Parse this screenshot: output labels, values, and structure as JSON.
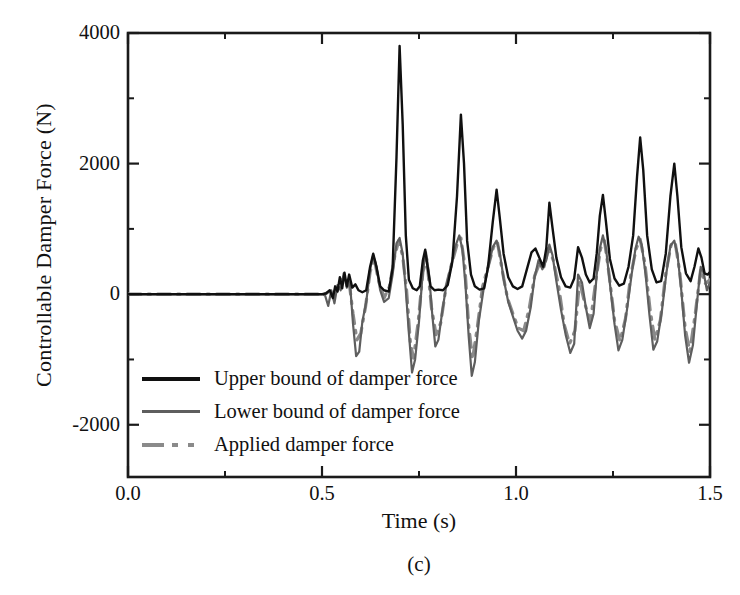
{
  "figure": {
    "panel_caption": "(c)"
  },
  "chart_data": {
    "type": "line",
    "title": "",
    "xlabel": "Time (s)",
    "ylabel": "Controllable Damper Force (N)",
    "xlim": [
      0.0,
      1.5
    ],
    "ylim": [
      -2800,
      4000
    ],
    "grid": false,
    "legend_position": "lower-left-inside",
    "x_major_ticks": [
      0.0,
      0.5,
      1.0,
      1.5
    ],
    "x_major_tick_labels": [
      "0.0",
      "0.5",
      "1.0",
      "1.5"
    ],
    "x_minor_ticks": [
      0.25,
      0.75,
      1.25
    ],
    "y_major_ticks": [
      -2000,
      0,
      2000,
      4000
    ],
    "y_major_tick_labels": [
      "-2000",
      "0",
      "2000",
      "4000"
    ],
    "y_minor_ticks": [
      -1000,
      1000,
      3000
    ],
    "excitation_start_time": 0.5,
    "series": [
      {
        "name": "Upper bound of damper force",
        "color": "#101010",
        "style": "solid",
        "width": 2.4,
        "points": [
          [
            0.0,
            0
          ],
          [
            0.48,
            0
          ],
          [
            0.5,
            0
          ],
          [
            0.51,
            10
          ],
          [
            0.52,
            60
          ],
          [
            0.528,
            -60
          ],
          [
            0.534,
            120
          ],
          [
            0.54,
            40
          ],
          [
            0.546,
            260
          ],
          [
            0.552,
            90
          ],
          [
            0.558,
            330
          ],
          [
            0.564,
            120
          ],
          [
            0.57,
            300
          ],
          [
            0.578,
            100
          ],
          [
            0.586,
            150
          ],
          [
            0.594,
            60
          ],
          [
            0.604,
            30
          ],
          [
            0.614,
            60
          ],
          [
            0.624,
            420
          ],
          [
            0.632,
            620
          ],
          [
            0.64,
            430
          ],
          [
            0.65,
            120
          ],
          [
            0.66,
            60
          ],
          [
            0.672,
            40
          ],
          [
            0.682,
            400
          ],
          [
            0.692,
            2100
          ],
          [
            0.7,
            3800
          ],
          [
            0.708,
            2600
          ],
          [
            0.716,
            900
          ],
          [
            0.724,
            220
          ],
          [
            0.734,
            90
          ],
          [
            0.744,
            60
          ],
          [
            0.752,
            120
          ],
          [
            0.76,
            520
          ],
          [
            0.766,
            680
          ],
          [
            0.772,
            420
          ],
          [
            0.78,
            120
          ],
          [
            0.79,
            60
          ],
          [
            0.8,
            70
          ],
          [
            0.812,
            60
          ],
          [
            0.824,
            140
          ],
          [
            0.836,
            500
          ],
          [
            0.848,
            1500
          ],
          [
            0.858,
            2750
          ],
          [
            0.866,
            2000
          ],
          [
            0.874,
            820
          ],
          [
            0.884,
            300
          ],
          [
            0.894,
            120
          ],
          [
            0.906,
            70
          ],
          [
            0.918,
            90
          ],
          [
            0.928,
            420
          ],
          [
            0.94,
            1100
          ],
          [
            0.95,
            1600
          ],
          [
            0.958,
            1180
          ],
          [
            0.968,
            620
          ],
          [
            0.98,
            260
          ],
          [
            0.992,
            120
          ],
          [
            1.004,
            80
          ],
          [
            1.016,
            120
          ],
          [
            1.028,
            380
          ],
          [
            1.04,
            640
          ],
          [
            1.05,
            700
          ],
          [
            1.06,
            560
          ],
          [
            1.07,
            420
          ],
          [
            1.078,
            700
          ],
          [
            1.086,
            1400
          ],
          [
            1.094,
            1020
          ],
          [
            1.104,
            560
          ],
          [
            1.116,
            260
          ],
          [
            1.128,
            120
          ],
          [
            1.14,
            100
          ],
          [
            1.15,
            240
          ],
          [
            1.16,
            720
          ],
          [
            1.17,
            560
          ],
          [
            1.18,
            300
          ],
          [
            1.19,
            180
          ],
          [
            1.2,
            240
          ],
          [
            1.208,
            620
          ],
          [
            1.216,
            1200
          ],
          [
            1.224,
            1520
          ],
          [
            1.232,
            1100
          ],
          [
            1.242,
            540
          ],
          [
            1.254,
            240
          ],
          [
            1.266,
            130
          ],
          [
            1.278,
            160
          ],
          [
            1.29,
            420
          ],
          [
            1.302,
            900
          ],
          [
            1.312,
            1800
          ],
          [
            1.32,
            2400
          ],
          [
            1.328,
            1900
          ],
          [
            1.338,
            900
          ],
          [
            1.35,
            380
          ],
          [
            1.362,
            180
          ],
          [
            1.374,
            200
          ],
          [
            1.386,
            620
          ],
          [
            1.398,
            1500
          ],
          [
            1.408,
            2000
          ],
          [
            1.416,
            1500
          ],
          [
            1.426,
            720
          ],
          [
            1.438,
            320
          ],
          [
            1.45,
            200
          ],
          [
            1.46,
            420
          ],
          [
            1.47,
            700
          ],
          [
            1.478,
            560
          ],
          [
            1.486,
            320
          ],
          [
            1.494,
            300
          ],
          [
            1.5,
            340
          ]
        ]
      },
      {
        "name": "Lower bound of damper force",
        "color": "#5e5e5e",
        "style": "solid",
        "width": 2.2,
        "points": [
          [
            0.0,
            0
          ],
          [
            0.48,
            0
          ],
          [
            0.5,
            0
          ],
          [
            0.508,
            -20
          ],
          [
            0.516,
            -180
          ],
          [
            0.524,
            60
          ],
          [
            0.532,
            -140
          ],
          [
            0.54,
            140
          ],
          [
            0.548,
            60
          ],
          [
            0.556,
            320
          ],
          [
            0.564,
            100
          ],
          [
            0.572,
            180
          ],
          [
            0.58,
            -460
          ],
          [
            0.588,
            -950
          ],
          [
            0.596,
            -880
          ],
          [
            0.604,
            -420
          ],
          [
            0.614,
            -120
          ],
          [
            0.624,
            380
          ],
          [
            0.632,
            600
          ],
          [
            0.64,
            420
          ],
          [
            0.65,
            60
          ],
          [
            0.66,
            -120
          ],
          [
            0.672,
            -60
          ],
          [
            0.682,
            300
          ],
          [
            0.692,
            780
          ],
          [
            0.7,
            860
          ],
          [
            0.708,
            620
          ],
          [
            0.716,
            60
          ],
          [
            0.724,
            -600
          ],
          [
            0.732,
            -1200
          ],
          [
            0.74,
            -1000
          ],
          [
            0.75,
            -420
          ],
          [
            0.76,
            360
          ],
          [
            0.768,
            640
          ],
          [
            0.776,
            300
          ],
          [
            0.784,
            -300
          ],
          [
            0.792,
            -800
          ],
          [
            0.8,
            -700
          ],
          [
            0.81,
            -260
          ],
          [
            0.82,
            120
          ],
          [
            0.832,
            420
          ],
          [
            0.844,
            740
          ],
          [
            0.854,
            900
          ],
          [
            0.862,
            680
          ],
          [
            0.87,
            120
          ],
          [
            0.878,
            -640
          ],
          [
            0.886,
            -1250
          ],
          [
            0.894,
            -1040
          ],
          [
            0.904,
            -420
          ],
          [
            0.916,
            60
          ],
          [
            0.928,
            400
          ],
          [
            0.94,
            720
          ],
          [
            0.95,
            820
          ],
          [
            0.958,
            640
          ],
          [
            0.968,
            240
          ],
          [
            0.98,
            -120
          ],
          [
            0.992,
            -340
          ],
          [
            1.004,
            -560
          ],
          [
            1.016,
            -680
          ],
          [
            1.026,
            -560
          ],
          [
            1.038,
            -200
          ],
          [
            1.048,
            260
          ],
          [
            1.058,
            520
          ],
          [
            1.068,
            380
          ],
          [
            1.078,
            520
          ],
          [
            1.086,
            760
          ],
          [
            1.094,
            600
          ],
          [
            1.104,
            200
          ],
          [
            1.116,
            -240
          ],
          [
            1.128,
            -620
          ],
          [
            1.14,
            -900
          ],
          [
            1.15,
            -760
          ],
          [
            1.16,
            300
          ],
          [
            1.17,
            180
          ],
          [
            1.18,
            -200
          ],
          [
            1.19,
            -520
          ],
          [
            1.2,
            -300
          ],
          [
            1.208,
            300
          ],
          [
            1.216,
            700
          ],
          [
            1.224,
            900
          ],
          [
            1.232,
            700
          ],
          [
            1.242,
            160
          ],
          [
            1.254,
            -460
          ],
          [
            1.264,
            -860
          ],
          [
            1.274,
            -700
          ],
          [
            1.286,
            -240
          ],
          [
            1.298,
            300
          ],
          [
            1.308,
            700
          ],
          [
            1.316,
            880
          ],
          [
            1.324,
            760
          ],
          [
            1.334,
            300
          ],
          [
            1.344,
            -320
          ],
          [
            1.354,
            -850
          ],
          [
            1.364,
            -720
          ],
          [
            1.376,
            -260
          ],
          [
            1.388,
            340
          ],
          [
            1.398,
            740
          ],
          [
            1.408,
            820
          ],
          [
            1.416,
            620
          ],
          [
            1.426,
            60
          ],
          [
            1.436,
            -640
          ],
          [
            1.446,
            -1050
          ],
          [
            1.456,
            -780
          ],
          [
            1.466,
            -160
          ],
          [
            1.476,
            420
          ],
          [
            1.484,
            320
          ],
          [
            1.492,
            60
          ],
          [
            1.5,
            180
          ]
        ]
      },
      {
        "name": "Applied damper force",
        "color": "#8a8a8a",
        "style": "dashdot",
        "width": 3.2,
        "points": [
          [
            0.0,
            0
          ],
          [
            0.48,
            0
          ],
          [
            0.5,
            0
          ],
          [
            0.51,
            10
          ],
          [
            0.52,
            40
          ],
          [
            0.53,
            -40
          ],
          [
            0.54,
            80
          ],
          [
            0.55,
            220
          ],
          [
            0.56,
            240
          ],
          [
            0.57,
            180
          ],
          [
            0.58,
            -300
          ],
          [
            0.59,
            -700
          ],
          [
            0.6,
            -600
          ],
          [
            0.612,
            -200
          ],
          [
            0.624,
            340
          ],
          [
            0.634,
            560
          ],
          [
            0.646,
            200
          ],
          [
            0.66,
            -60
          ],
          [
            0.674,
            120
          ],
          [
            0.688,
            600
          ],
          [
            0.698,
            820
          ],
          [
            0.708,
            580
          ],
          [
            0.718,
            60
          ],
          [
            0.728,
            -760
          ],
          [
            0.736,
            -980
          ],
          [
            0.748,
            -420
          ],
          [
            0.76,
            340
          ],
          [
            0.77,
            540
          ],
          [
            0.782,
            -200
          ],
          [
            0.794,
            -620
          ],
          [
            0.806,
            -440
          ],
          [
            0.82,
            120
          ],
          [
            0.834,
            460
          ],
          [
            0.848,
            760
          ],
          [
            0.858,
            860
          ],
          [
            0.868,
            440
          ],
          [
            0.878,
            -480
          ],
          [
            0.888,
            -1000
          ],
          [
            0.9,
            -520
          ],
          [
            0.914,
            120
          ],
          [
            0.928,
            420
          ],
          [
            0.942,
            720
          ],
          [
            0.952,
            800
          ],
          [
            0.964,
            380
          ],
          [
            0.978,
            -60
          ],
          [
            0.992,
            -300
          ],
          [
            1.006,
            -520
          ],
          [
            1.02,
            -560
          ],
          [
            1.034,
            -220
          ],
          [
            1.048,
            280
          ],
          [
            1.06,
            460
          ],
          [
            1.072,
            420
          ],
          [
            1.084,
            700
          ],
          [
            1.096,
            520
          ],
          [
            1.11,
            120
          ],
          [
            1.124,
            -460
          ],
          [
            1.138,
            -760
          ],
          [
            1.152,
            -560
          ],
          [
            1.164,
            200
          ],
          [
            1.178,
            -160
          ],
          [
            1.192,
            -420
          ],
          [
            1.206,
            220
          ],
          [
            1.218,
            700
          ],
          [
            1.228,
            820
          ],
          [
            1.24,
            300
          ],
          [
            1.254,
            -400
          ],
          [
            1.268,
            -720
          ],
          [
            1.282,
            -380
          ],
          [
            1.296,
            300
          ],
          [
            1.31,
            700
          ],
          [
            1.32,
            840
          ],
          [
            1.332,
            480
          ],
          [
            1.346,
            -260
          ],
          [
            1.358,
            -700
          ],
          [
            1.372,
            -400
          ],
          [
            1.386,
            320
          ],
          [
            1.4,
            760
          ],
          [
            1.41,
            800
          ],
          [
            1.422,
            340
          ],
          [
            1.436,
            -520
          ],
          [
            1.448,
            -880
          ],
          [
            1.462,
            -300
          ],
          [
            1.476,
            380
          ],
          [
            1.488,
            160
          ],
          [
            1.5,
            220
          ]
        ]
      }
    ]
  }
}
